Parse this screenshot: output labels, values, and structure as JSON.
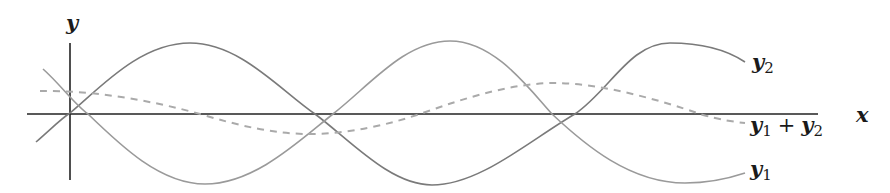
{
  "figure": {
    "type": "wave superposition diagram",
    "axes": {
      "x_label": "x",
      "y_label": "y"
    },
    "curves": [
      {
        "id": "y1",
        "label_base": "y",
        "label_sub": "1",
        "style": "solid",
        "color": "#9a9a9a"
      },
      {
        "id": "y2",
        "label_base": "y",
        "label_sub": "2",
        "style": "solid",
        "color": "#7a7a7a"
      },
      {
        "id": "sum",
        "label": "y1 + y2",
        "style": "dashed",
        "color": "#aaaaaa"
      }
    ],
    "labels": {
      "y2": {
        "base": "y",
        "sub": "2"
      },
      "sum": {
        "a_base": "y",
        "a_sub": "1",
        "plus": "+",
        "b_base": "y",
        "b_sub": "2"
      },
      "y1": {
        "base": "y",
        "sub": "1"
      }
    },
    "colors": {
      "axis": "#222222",
      "y1": "#9a9a9a",
      "y2": "#7a7a7a",
      "sum": "#aaaaaa"
    }
  }
}
